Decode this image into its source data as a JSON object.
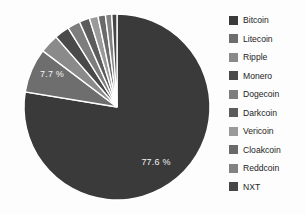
{
  "chart_data": {
    "type": "pie",
    "title": "",
    "subtitle": "",
    "xlabel": "",
    "ylabel": "",
    "legend_position": "right",
    "grid": false,
    "start_angle_deg": 0,
    "direction": "clockwise",
    "categories": [
      "Bitcoin",
      "Litecoin",
      "Ripple",
      "Monero",
      "Dogecoin",
      "Darkcoin",
      "Vericoin",
      "Cloakcoin",
      "Reddcoin",
      "NXT"
    ],
    "values": [
      77.6,
      7.7,
      3.3,
      2.6,
      2.2,
      1.8,
      1.5,
      1.3,
      1.1,
      0.9
    ],
    "value_unit": "%",
    "slice_colors": [
      "#3a3a3a",
      "#6e6e6e",
      "#8a8a8a",
      "#4a4a4a",
      "#7d7d7d",
      "#5c5c5c",
      "#9a9a9a",
      "#6a6a6a",
      "#828282",
      "#464646"
    ],
    "visible_labels": [
      {
        "category": "Bitcoin",
        "text": "77.6 %",
        "value": 77.6
      },
      {
        "category": "Litecoin",
        "text": "7.7 %",
        "value": 7.7
      }
    ],
    "annotations": []
  },
  "legend": {
    "items": [
      {
        "label": "Bitcoin",
        "color": "#3a3a3a"
      },
      {
        "label": "Litecoin",
        "color": "#6e6e6e"
      },
      {
        "label": "Ripple",
        "color": "#8a8a8a"
      },
      {
        "label": "Monero",
        "color": "#4a4a4a"
      },
      {
        "label": "Dogecoin",
        "color": "#7d7d7d"
      },
      {
        "label": "Darkcoin",
        "color": "#5c5c5c"
      },
      {
        "label": "Vericoin",
        "color": "#9a9a9a"
      },
      {
        "label": "Cloakcoin",
        "color": "#6a6a6a"
      },
      {
        "label": "Reddcoin",
        "color": "#828282"
      },
      {
        "label": "NXT",
        "color": "#464646"
      }
    ]
  },
  "labels": {
    "bitcoin_pct": "77.6 %",
    "litecoin_pct": "7.7 %"
  }
}
